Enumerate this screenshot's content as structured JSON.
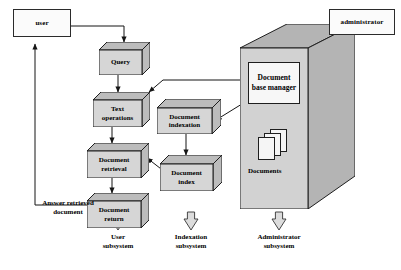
{
  "diagram": {
    "colors": {
      "box_front": "#d6d6d6",
      "box_shade": "#bcbcbc",
      "container_front": "#d2d2d2",
      "container_shade": "#b4b4b4",
      "actor_fill": "#fbfbfb",
      "stroke": "#1e1e1e",
      "text": "#000000"
    },
    "actors": [
      {
        "id": "user",
        "label": "user"
      },
      {
        "id": "administrator",
        "label": "administrator"
      }
    ],
    "process_boxes": [
      {
        "id": "query",
        "label_line1": "Query",
        "label_line2": ""
      },
      {
        "id": "text-operations",
        "label_line1": "Text",
        "label_line2": "operations"
      },
      {
        "id": "document-retrieval",
        "label_line1": "Document",
        "label_line2": "retrieval"
      },
      {
        "id": "document-return",
        "label_line1": "Document",
        "label_line2": "return"
      },
      {
        "id": "document-indexation",
        "label_line1": "Document",
        "label_line2": "indexation"
      },
      {
        "id": "document-index",
        "label_line1": "Document",
        "label_line2": "index"
      }
    ],
    "container": {
      "manager_line1": "Document",
      "manager_line2": "base manager",
      "documents_label": "Documents"
    },
    "annotations": {
      "answer_line1": "Answer retrieved",
      "answer_line2": "document"
    },
    "subsystems": [
      {
        "id": "user-subsystem",
        "line1": "User",
        "line2": "subsystem"
      },
      {
        "id": "indexation-subsystem",
        "line1": "Indexation",
        "line2": "subsystem"
      },
      {
        "id": "administrator-subsystem",
        "line1": "Administrator",
        "line2": "subsystem"
      }
    ],
    "flows": [
      {
        "from": "user",
        "to": "query",
        "kind": "arrow"
      },
      {
        "from": "query",
        "to": "text-operations",
        "kind": "arrow"
      },
      {
        "from": "text-operations",
        "to": "document-retrieval",
        "kind": "arrow"
      },
      {
        "from": "document-retrieval",
        "to": "document-return",
        "kind": "arrow"
      },
      {
        "from": "document-return",
        "to": "user",
        "kind": "arrow"
      },
      {
        "from": "document-base-manager",
        "to": "text-operations",
        "kind": "arrow"
      },
      {
        "from": "document-base-manager",
        "to": "document-indexation",
        "kind": "arrow"
      },
      {
        "from": "document-indexation",
        "to": "document-index",
        "kind": "arrow"
      },
      {
        "from": "document-index",
        "to": "document-retrieval",
        "kind": "arrow"
      },
      {
        "from": "administrator",
        "to": "document-base-container",
        "kind": "arrow"
      }
    ]
  }
}
